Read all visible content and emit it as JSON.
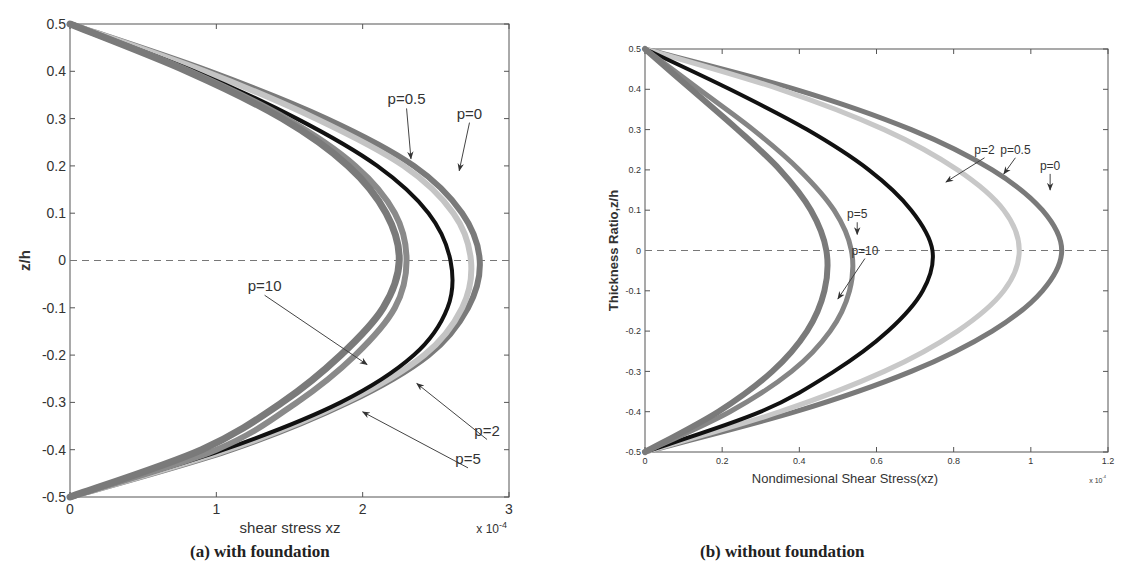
{
  "chart_data": [
    {
      "type": "line",
      "panel": "a",
      "caption": "(a) with foundation",
      "xlabel": "shear stress  xz",
      "ylabel": "z/h",
      "x_multiplier": "x 10",
      "x_multiplier_exp": "-4",
      "xlim": [
        0,
        3
      ],
      "ylim": [
        -0.5,
        0.5
      ],
      "xticks": [
        "0",
        "1",
        "2",
        "3"
      ],
      "yticks": [
        "0.5",
        "0.4",
        "0.3",
        "0.2",
        "0.1",
        "0",
        "-0.1",
        "-0.2",
        "-0.3",
        "-0.4",
        "-0.5"
      ],
      "reference_line": {
        "y": 0,
        "style": "dashed"
      },
      "z": [
        0.5,
        0.4,
        0.3,
        0.2,
        0.1,
        0.0,
        -0.1,
        -0.2,
        -0.3,
        -0.4,
        -0.5
      ],
      "series": [
        {
          "name": "p=0",
          "color": "#7a7a7a",
          "width": 6,
          "values": [
            0,
            0.95,
            1.75,
            2.35,
            2.68,
            2.8,
            2.72,
            2.45,
            1.9,
            1.1,
            0
          ]
        },
        {
          "name": "p=0.5",
          "color": "#c4c4c4",
          "width": 6,
          "values": [
            0,
            0.92,
            1.68,
            2.28,
            2.62,
            2.74,
            2.68,
            2.42,
            1.88,
            1.08,
            0
          ]
        },
        {
          "name": "p=2",
          "color": "#111111",
          "width": 4,
          "values": [
            0,
            0.85,
            1.55,
            2.1,
            2.45,
            2.6,
            2.58,
            2.35,
            1.85,
            1.05,
            0
          ]
        },
        {
          "name": "p=5",
          "color": "#8a8a8a",
          "width": 6,
          "values": [
            0,
            0.82,
            1.48,
            1.95,
            2.22,
            2.3,
            2.22,
            1.95,
            1.55,
            1.0,
            0
          ]
        },
        {
          "name": "p=10",
          "color": "#7a7a7a",
          "width": 7,
          "values": [
            0,
            0.8,
            1.45,
            1.9,
            2.16,
            2.25,
            2.14,
            1.85,
            1.45,
            0.9,
            0
          ]
        }
      ],
      "annotations": [
        {
          "text": "p=0.5",
          "label_x": 2.3,
          "label_y": 0.33,
          "arrow_to_x": 2.33,
          "arrow_to_y": 0.215
        },
        {
          "text": "p=0",
          "label_x": 2.73,
          "label_y": 0.3,
          "arrow_to_x": 2.66,
          "arrow_to_y": 0.19
        },
        {
          "text": "p=10",
          "label_x": 1.33,
          "label_y": -0.065,
          "arrow_to_x": 2.03,
          "arrow_to_y": -0.22
        },
        {
          "text": "p=2",
          "label_x": 2.85,
          "label_y": -0.37,
          "arrow_to_x": 2.37,
          "arrow_to_y": -0.26
        },
        {
          "text": "p=5",
          "label_x": 2.72,
          "label_y": -0.43,
          "arrow_to_x": 2.0,
          "arrow_to_y": -0.32
        }
      ]
    },
    {
      "type": "line",
      "panel": "b",
      "caption": "(b) without  foundation",
      "xlabel": "Nondimesional Shear Stress(xz)",
      "ylabel": "Thickness Ratio,z/h",
      "x_multiplier": "x 10",
      "x_multiplier_exp": "-4",
      "xlim": [
        0,
        1.2
      ],
      "ylim": [
        -0.5,
        0.5
      ],
      "xticks": [
        "0",
        "0.2",
        "0.4",
        "0.6",
        "0.8",
        "1",
        "1.2"
      ],
      "yticks": [
        "0.5",
        "0.4",
        "0.3",
        "0.2",
        "0.1",
        "0",
        "-0.1",
        "-0.2",
        "-0.3",
        "-0.4",
        "-0.5"
      ],
      "reference_line": {
        "y": 0,
        "style": "dashed"
      },
      "z": [
        0.5,
        0.4,
        0.3,
        0.2,
        0.1,
        0.0,
        -0.1,
        -0.2,
        -0.3,
        -0.4,
        -0.5
      ],
      "series": [
        {
          "name": "p=0",
          "color": "#7a7a7a",
          "width": 5,
          "values": [
            0,
            0.39,
            0.69,
            0.9,
            1.03,
            1.08,
            1.03,
            0.9,
            0.69,
            0.39,
            0
          ]
        },
        {
          "name": "p=0.5",
          "color": "#c8c8c8",
          "width": 5,
          "values": [
            0,
            0.35,
            0.62,
            0.81,
            0.93,
            0.97,
            0.93,
            0.81,
            0.62,
            0.35,
            0
          ]
        },
        {
          "name": "p=2",
          "color": "#111111",
          "width": 4,
          "values": [
            0,
            0.22,
            0.42,
            0.58,
            0.69,
            0.745,
            0.72,
            0.63,
            0.49,
            0.3,
            0
          ]
        },
        {
          "name": "p=5",
          "color": "#858585",
          "width": 5,
          "values": [
            0,
            0.14,
            0.28,
            0.4,
            0.49,
            0.535,
            0.53,
            0.48,
            0.38,
            0.22,
            0
          ]
        },
        {
          "name": "p=10",
          "color": "#7a7a7a",
          "width": 6,
          "values": [
            0,
            0.12,
            0.24,
            0.35,
            0.43,
            0.47,
            0.465,
            0.42,
            0.33,
            0.19,
            0
          ]
        }
      ],
      "annotations": [
        {
          "text": "p=2",
          "label_x": 0.88,
          "label_y": 0.24,
          "arrow_to_x": 0.78,
          "arrow_to_y": 0.17
        },
        {
          "text": "p=0.5",
          "label_x": 0.96,
          "label_y": 0.24,
          "arrow_to_x": 0.93,
          "arrow_to_y": 0.19
        },
        {
          "text": "p=0",
          "label_x": 1.05,
          "label_y": 0.2,
          "arrow_to_x": 1.05,
          "arrow_to_y": 0.15
        },
        {
          "text": "p=5",
          "label_x": 0.55,
          "label_y": 0.08,
          "arrow_to_x": 0.55,
          "arrow_to_y": 0.04
        },
        {
          "text": "p=10",
          "label_x": 0.57,
          "label_y": -0.01,
          "arrow_to_x": 0.5,
          "arrow_to_y": -0.12
        }
      ]
    }
  ],
  "captions": {
    "a": "(a) with foundation",
    "b": "(b) without  foundation"
  }
}
